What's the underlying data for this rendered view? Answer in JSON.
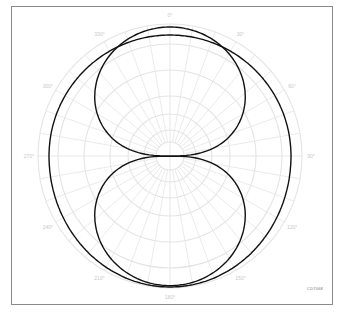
{
  "chart_data": {
    "type": "polar",
    "title": "",
    "angle_ticks": [
      "0°",
      "30°",
      "60°",
      "90°",
      "120°",
      "150°",
      "180°",
      "210°",
      "240°",
      "270°",
      "300°",
      "330°"
    ],
    "radial_rings": 5,
    "radial_spoke_step_deg": 10,
    "series": [
      {
        "name": "Figure-8 (bidirectional) pattern",
        "pattern": "figure-8",
        "description": "Two lobes along 0°–180° axis, nulls at 90° and 270°",
        "color": "#111111"
      },
      {
        "name": "Wide (near-omnidirectional) pattern",
        "pattern": "wide-oval",
        "description": "Broad pattern slightly wider at 90°/270° than front/back",
        "color": "#111111"
      }
    ],
    "grid": true,
    "legend": null
  },
  "labels": {
    "figure_code": "CD7068"
  },
  "colors": {
    "curve": "#111111",
    "grid": "#e4e4e4",
    "label": "#c8c8c8",
    "frame": "#8a8a8a"
  }
}
